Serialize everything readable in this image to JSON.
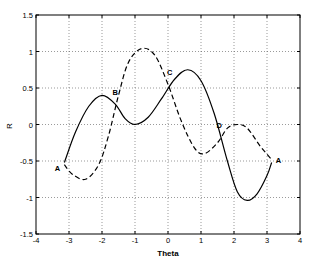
{
  "chart_data": {
    "type": "line",
    "title": "",
    "xlabel": "Theta",
    "ylabel": "R",
    "xlim": [
      -4,
      4
    ],
    "ylim": [
      -1.5,
      1.5
    ],
    "xticks": [
      "-4",
      "-3",
      "-2",
      "-1",
      "0",
      "1",
      "2",
      "3",
      "4"
    ],
    "yticks": [
      "-1.5",
      "-1",
      "-0.5",
      "0",
      "0.5",
      "1",
      "1.5"
    ],
    "grid": true,
    "legend": null,
    "series": [
      {
        "name": "solid",
        "style": "solid",
        "color": "#000000",
        "x": [
          -3.14,
          -2.8,
          -2.4,
          -2.0,
          -1.6,
          -1.3,
          -1.0,
          -0.6,
          -0.2,
          0.2,
          0.6,
          1.0,
          1.4,
          1.8,
          2.1,
          2.4,
          2.7,
          3.0,
          3.14
        ],
        "y": [
          -0.52,
          -0.1,
          0.25,
          0.4,
          0.28,
          0.08,
          0.0,
          0.1,
          0.35,
          0.62,
          0.75,
          0.6,
          0.15,
          -0.5,
          -0.92,
          -1.04,
          -0.95,
          -0.7,
          -0.52
        ]
      },
      {
        "name": "dashed",
        "style": "dashed",
        "color": "#000000",
        "x": [
          -3.14,
          -2.9,
          -2.5,
          -2.1,
          -1.8,
          -1.5,
          -1.2,
          -0.8,
          -0.4,
          0.0,
          0.4,
          0.8,
          1.1,
          1.5,
          1.8,
          2.1,
          2.4,
          2.8,
          3.14
        ],
        "y": [
          -0.55,
          -0.68,
          -0.75,
          -0.55,
          -0.15,
          0.4,
          0.85,
          1.04,
          0.95,
          0.55,
          0.05,
          -0.32,
          -0.4,
          -0.25,
          -0.05,
          0.0,
          -0.05,
          -0.3,
          -0.48
        ]
      }
    ],
    "annotations": [
      {
        "text": "A",
        "x": -3.35,
        "y": -0.6
      },
      {
        "text": "B",
        "x": -1.6,
        "y": 0.45
      },
      {
        "text": "C",
        "x": 0.05,
        "y": 0.72
      },
      {
        "text": "D",
        "x": 1.55,
        "y": 0.0
      },
      {
        "text": "A",
        "x": 3.35,
        "y": -0.48
      }
    ]
  }
}
